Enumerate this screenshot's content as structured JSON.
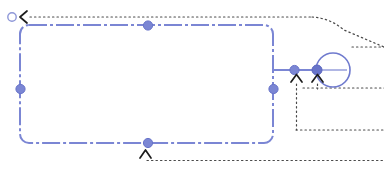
{
  "canvas": {
    "name": "shape-selection-canvas",
    "width": 384,
    "height": 172,
    "background_color": "#ffffff",
    "label": "Canvas"
  },
  "theme": {
    "selection_color": "#7b86d4",
    "handle_fill": "#7b86d4",
    "handle_stroke": "#5f6bc4",
    "guide_color": "#5a5a5a",
    "arrow_color": "#222222",
    "node_stroke": "#6f7ace"
  },
  "selection": {
    "label": "Selected shape",
    "shape_name": "rounded-rectangle",
    "dash_pattern": "dash-dot",
    "stroke_width": 2,
    "corner_radius": 8,
    "bounds": {
      "x": 20,
      "y": 25,
      "width": 253,
      "height": 118
    },
    "rotate_handle": {
      "label": "Rotate",
      "x": 12,
      "y": 16,
      "radius": 4
    },
    "handles": [
      {
        "name": "handle-top-center",
        "label": "Top center",
        "x": 148,
        "y": 25
      },
      {
        "name": "handle-middle-left",
        "label": "Middle left",
        "x": 20,
        "y": 89
      },
      {
        "name": "handle-middle-right",
        "label": "Middle right",
        "x": 273,
        "y": 89
      },
      {
        "name": "handle-bottom-center",
        "label": "Bottom center",
        "x": 148,
        "y": 143
      }
    ]
  },
  "node": {
    "name": "circle-node",
    "label": "Circle node",
    "center_x": 333,
    "center_y": 70,
    "radius": 17,
    "has_center_line": true,
    "connector": {
      "label": "Connector",
      "from_x": 273,
      "to_x": 316,
      "y": 70,
      "dot_x": 294,
      "anchor_x": 316
    }
  },
  "arrows": [
    {
      "name": "arrow-up-left",
      "label": "Up arrow left",
      "x": 296,
      "y": 78
    },
    {
      "name": "arrow-up-right",
      "label": "Up arrow right",
      "x": 317,
      "y": 78
    },
    {
      "name": "arrow-up-bottom-center",
      "label": "Up arrow bottom center",
      "x": 145,
      "y": 152
    },
    {
      "name": "arrow-left-top",
      "label": "Left arrow top",
      "x": 24,
      "y": 17
    }
  ],
  "guides": [
    {
      "name": "guide-top-horizontal",
      "label": "Top horizontal guide",
      "x1": 28,
      "y1": 17,
      "x2": 310,
      "y2": 17
    },
    {
      "name": "guide-diagonal",
      "label": "Diagonal guide",
      "x1": 310,
      "y1": 17,
      "x2": 384,
      "y2": 47
    },
    {
      "name": "guide-bottom-horizontal",
      "label": "Bottom horizontal guide",
      "x1": 150,
      "y1": 160,
      "x2": 384,
      "y2": 160
    },
    {
      "name": "guide-node-right",
      "label": "Node right guide",
      "x1": 350,
      "y1": 47,
      "x2": 384,
      "y2": 47
    },
    {
      "name": "guide-vertical-left",
      "label": "Left vertical guide",
      "x1": 296,
      "y1": 84,
      "x2": 296,
      "y2": 130
    },
    {
      "name": "guide-vertical-right",
      "label": "Right vertical guide",
      "x1": 317,
      "y1": 84,
      "x2": 317,
      "y2": 88
    },
    {
      "name": "guide-inner-horizontal",
      "label": "Inner horizontal guide",
      "x1": 303,
      "y1": 88,
      "x2": 384,
      "y2": 88
    },
    {
      "name": "guide-box-bottom",
      "label": "Box bottom guide",
      "x1": 296,
      "y1": 130,
      "x2": 384,
      "y2": 130
    },
    {
      "name": "guide-bottom-center-drop",
      "label": "Bottom center drop guide",
      "x1": 145,
      "y1": 158,
      "x2": 145,
      "y2": 160
    }
  ],
  "a11y": {
    "canvas_description": "Vector editor canvas with a selected rounded rectangle, resize handles, rotate handle, a circle node connector and dotted alignment guides."
  }
}
